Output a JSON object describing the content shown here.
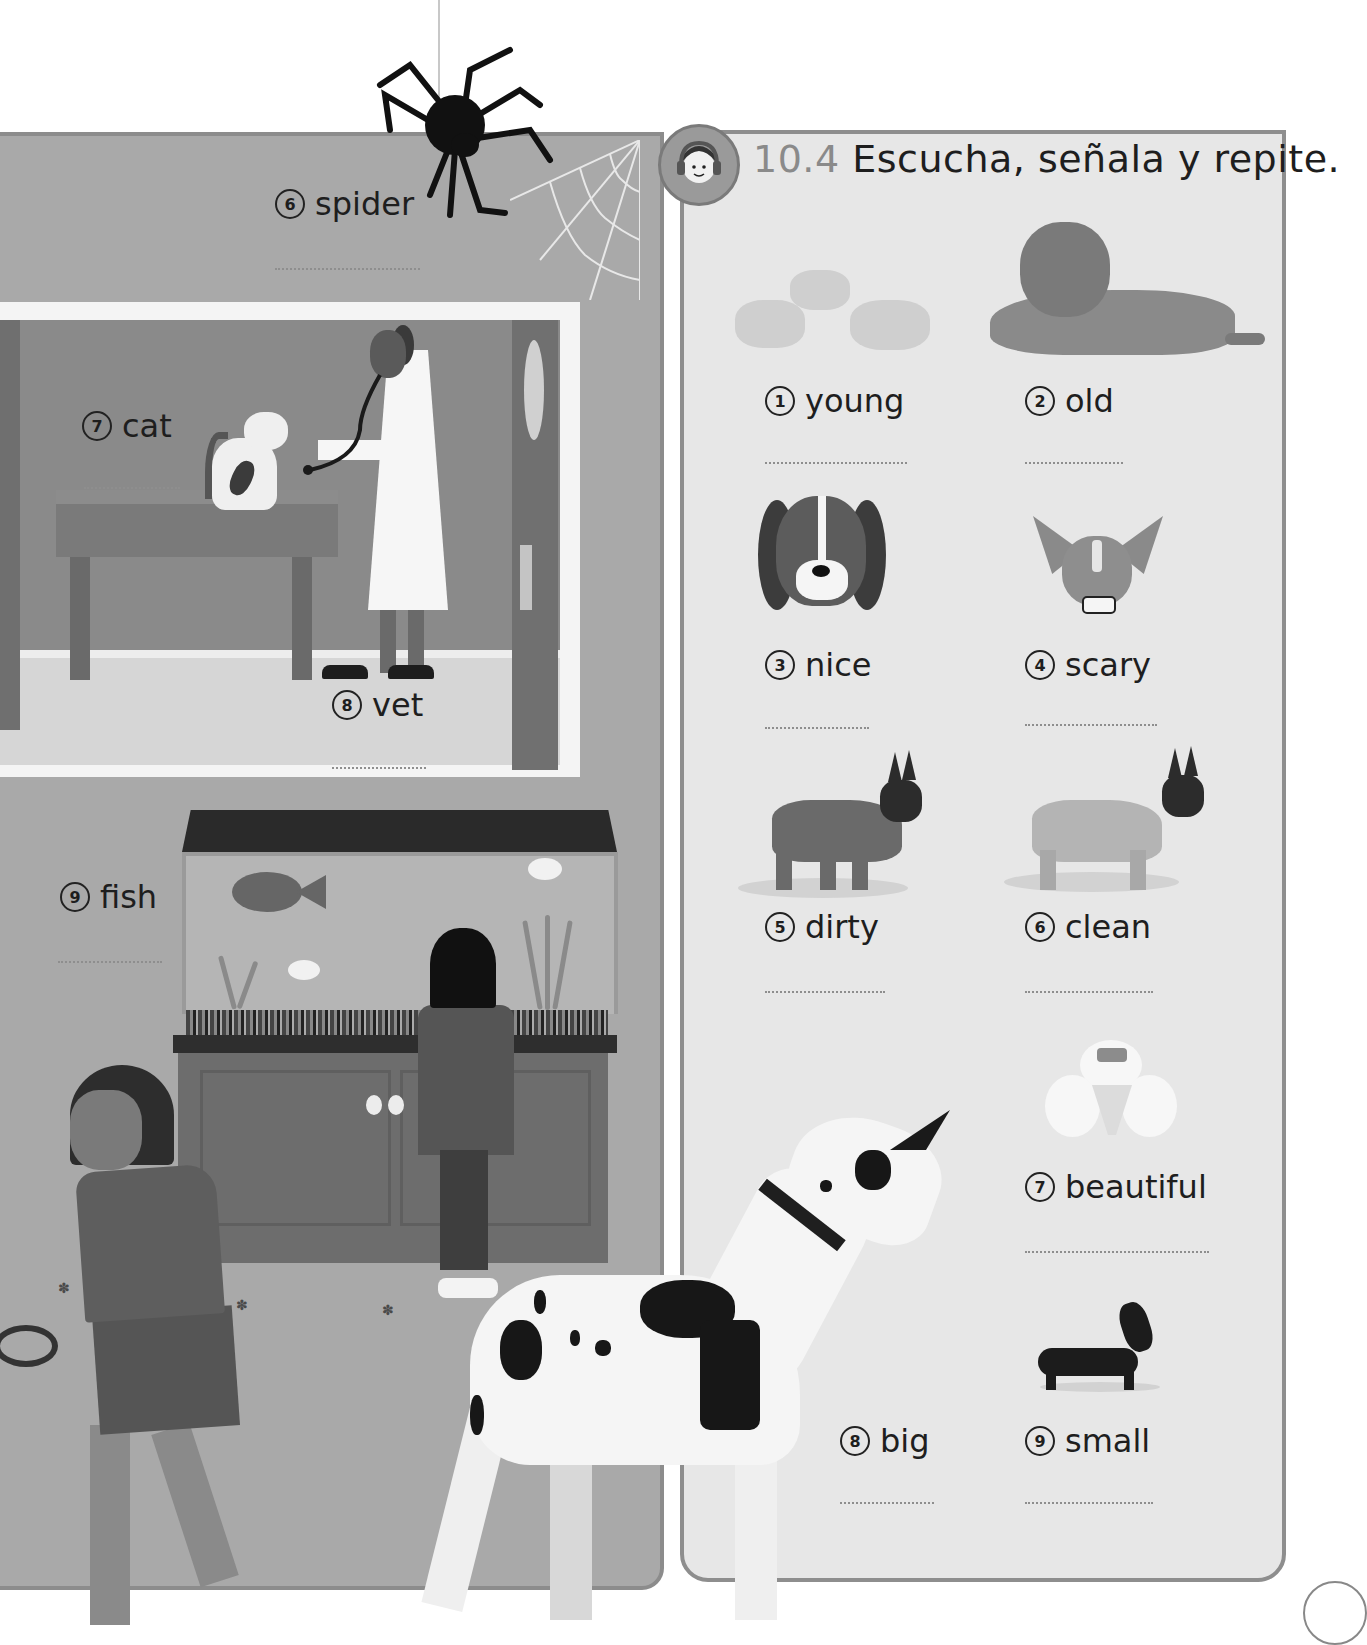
{
  "left_panel": {
    "items": [
      {
        "number": "6",
        "word": "spider"
      },
      {
        "number": "7",
        "word": "cat"
      },
      {
        "number": "8",
        "word": "vet"
      },
      {
        "number": "9",
        "word": "fish"
      }
    ]
  },
  "right_panel": {
    "activity": {
      "number": "10.4",
      "instruction": "Escucha, señala y repite.",
      "icon": "headphones-child-icon"
    },
    "items": [
      {
        "number": "1",
        "word": "young",
        "picture": "puppies"
      },
      {
        "number": "2",
        "word": "old",
        "picture": "old-dog"
      },
      {
        "number": "3",
        "word": "nice",
        "picture": "beagle-face"
      },
      {
        "number": "4",
        "word": "scary",
        "picture": "chihuahua-face"
      },
      {
        "number": "5",
        "word": "dirty",
        "picture": "dirty-french-bulldog"
      },
      {
        "number": "6",
        "word": "clean",
        "picture": "clean-french-bulldog"
      },
      {
        "number": "7",
        "word": "beautiful",
        "picture": "poodle"
      },
      {
        "number": "8",
        "word": "big",
        "picture": "great-dane"
      },
      {
        "number": "9",
        "word": "small",
        "picture": "dachshund"
      }
    ]
  },
  "colors": {
    "left_panel_bg": "#a9a9a9",
    "right_panel_bg": "#e7e7e7",
    "panel_border": "#8e8e8e",
    "activity_number": "#8a8a8a",
    "text": "#1e1e1e"
  }
}
